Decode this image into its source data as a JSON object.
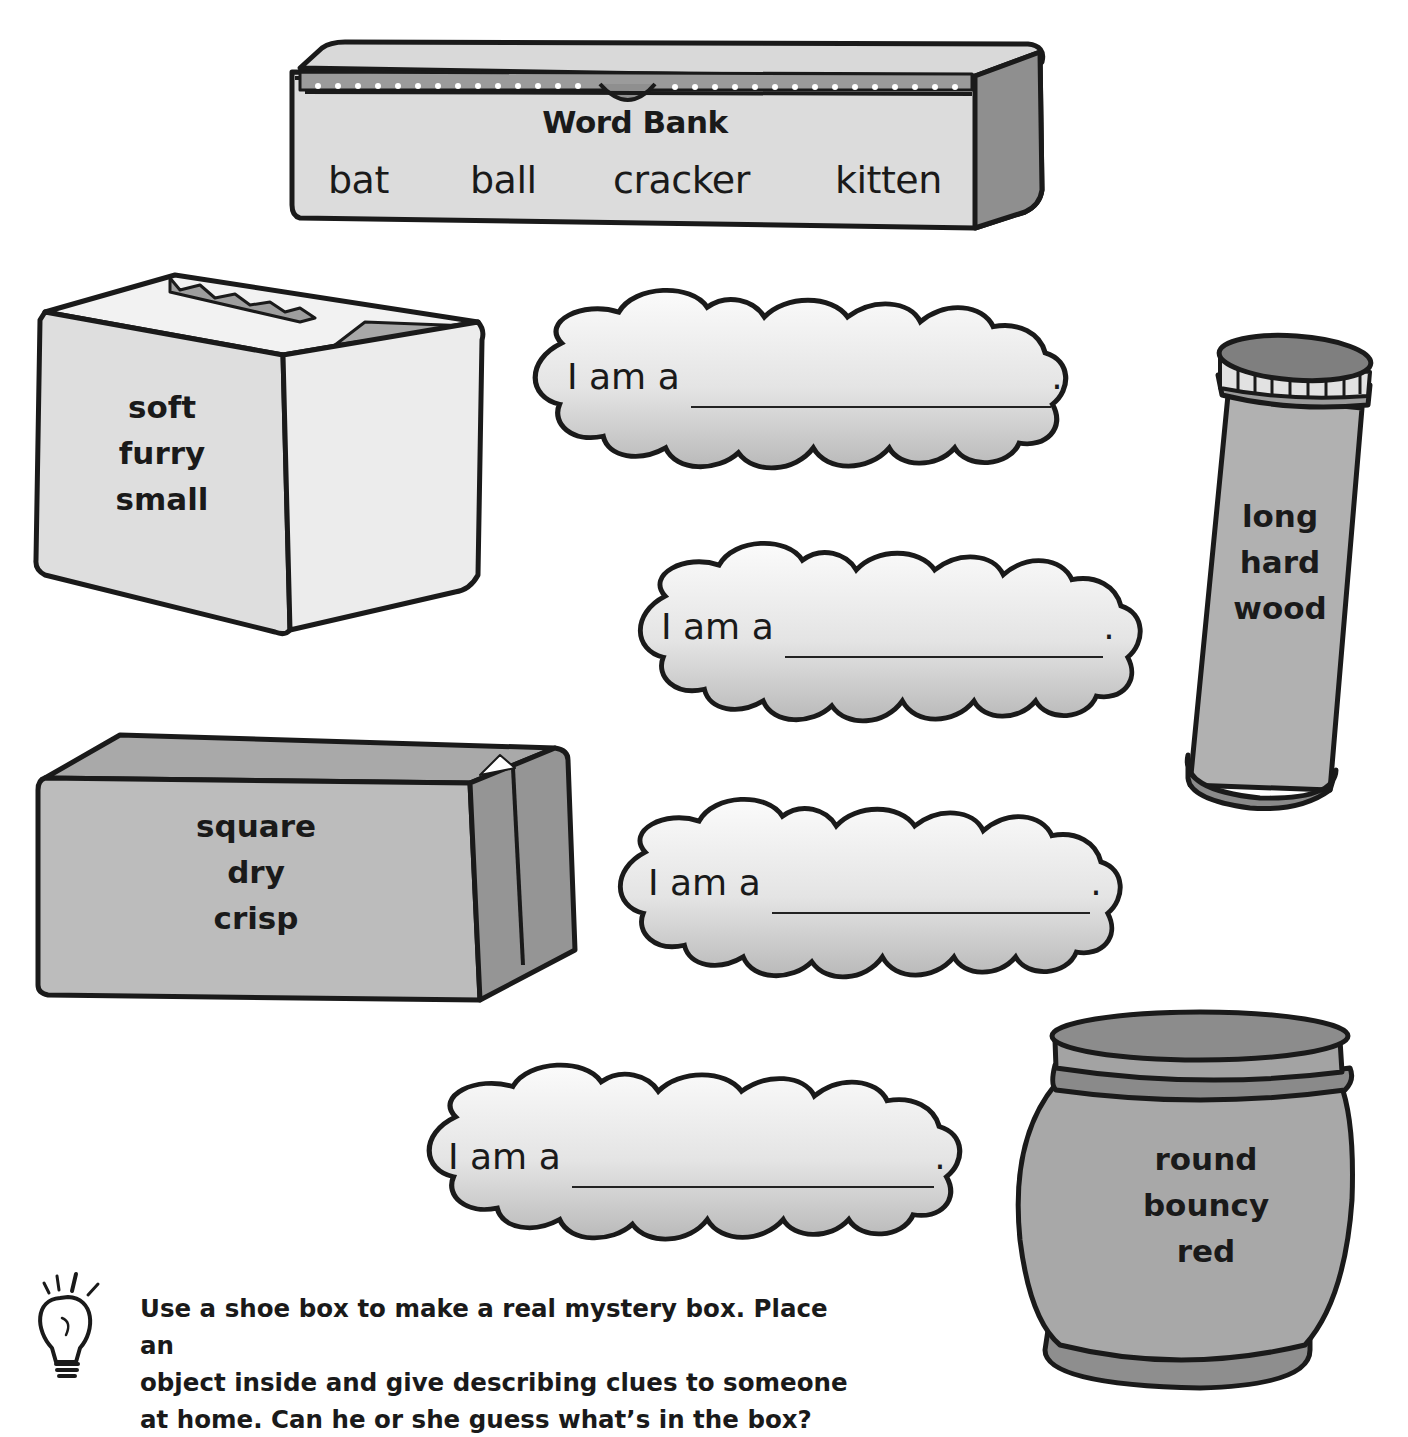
{
  "word_bank": {
    "title": "Word Bank",
    "words": [
      "bat",
      "ball",
      "cracker",
      "kitten"
    ]
  },
  "mystery_objects": [
    {
      "shape": "open-box",
      "clues": [
        "soft",
        "furry",
        "small"
      ]
    },
    {
      "shape": "tube",
      "clues": [
        "long",
        "hard",
        "wood"
      ]
    },
    {
      "shape": "closed-box",
      "clues": [
        "square",
        "dry",
        "crisp"
      ]
    },
    {
      "shape": "canister",
      "clues": [
        "round",
        "bouncy",
        "red"
      ]
    }
  ],
  "answer_clouds": [
    {
      "prompt": "I am a",
      "value": "",
      "end": "."
    },
    {
      "prompt": "I am a",
      "value": "",
      "end": "."
    },
    {
      "prompt": "I am a",
      "value": "",
      "end": "."
    },
    {
      "prompt": "I am a",
      "value": "",
      "end": "."
    }
  ],
  "tip": {
    "icon": "lightbulb-icon",
    "lines": [
      "Use a shoe box to make a real mystery box. Place an",
      "object inside and give describing clues to someone",
      "at home. Can he or she guess what’s in the box?"
    ]
  },
  "colors": {
    "outline": "#1a1a1a",
    "light_fill": "#e6e6e6",
    "mid_fill": "#b4b4b4",
    "dark_fill": "#8c8c8c"
  }
}
